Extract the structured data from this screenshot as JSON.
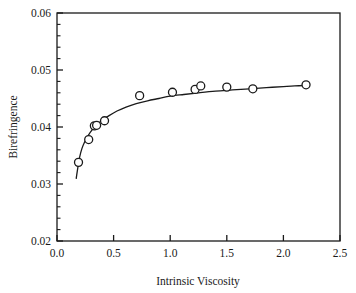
{
  "chart_data": {
    "type": "scatter",
    "title": "",
    "xlabel": "Intrinsic Viscosity",
    "ylabel": "Birefringence",
    "xlim": [
      0.0,
      2.5
    ],
    "ylim": [
      0.02,
      0.06
    ],
    "xticks": [
      0.0,
      0.5,
      1.0,
      1.5,
      2.0,
      2.5
    ],
    "xtick_labels": [
      "0.0",
      "0.5",
      "1.0",
      "1.5",
      "2.0",
      "2.5"
    ],
    "yticks": [
      0.02,
      0.03,
      0.04,
      0.05,
      0.06
    ],
    "ytick_labels": [
      "0.02",
      "0.03",
      "0.04",
      "0.05",
      "0.06"
    ],
    "y_minor_tick_count": 4,
    "x_minor_tick_count": 0,
    "grid": false,
    "legend": null,
    "marker": "open-circle",
    "series": [
      {
        "name": "Birefringence vs Intrinsic Viscosity",
        "points": [
          {
            "x": 0.19,
            "y": 0.0338
          },
          {
            "x": 0.28,
            "y": 0.0378
          },
          {
            "x": 0.33,
            "y": 0.0402
          },
          {
            "x": 0.35,
            "y": 0.0403
          },
          {
            "x": 0.42,
            "y": 0.0411
          },
          {
            "x": 0.73,
            "y": 0.0455
          },
          {
            "x": 1.02,
            "y": 0.0461
          },
          {
            "x": 1.22,
            "y": 0.0466
          },
          {
            "x": 1.27,
            "y": 0.0472
          },
          {
            "x": 1.5,
            "y": 0.047
          },
          {
            "x": 1.73,
            "y": 0.0467
          },
          {
            "x": 2.2,
            "y": 0.0474
          }
        ]
      }
    ],
    "fit_curve": {
      "name": "fitted-curve",
      "points": [
        {
          "x": 0.17,
          "y": 0.031
        },
        {
          "x": 0.185,
          "y": 0.033
        },
        {
          "x": 0.2,
          "y": 0.0347
        },
        {
          "x": 0.22,
          "y": 0.0362
        },
        {
          "x": 0.245,
          "y": 0.0374
        },
        {
          "x": 0.275,
          "y": 0.0385
        },
        {
          "x": 0.31,
          "y": 0.0395
        },
        {
          "x": 0.35,
          "y": 0.0404
        },
        {
          "x": 0.4,
          "y": 0.0412
        },
        {
          "x": 0.46,
          "y": 0.042
        },
        {
          "x": 0.53,
          "y": 0.0428
        },
        {
          "x": 0.61,
          "y": 0.0435
        },
        {
          "x": 0.7,
          "y": 0.0441
        },
        {
          "x": 0.8,
          "y": 0.0446
        },
        {
          "x": 0.9,
          "y": 0.045
        },
        {
          "x": 1.0,
          "y": 0.0454
        },
        {
          "x": 1.12,
          "y": 0.0457
        },
        {
          "x": 1.25,
          "y": 0.046
        },
        {
          "x": 1.4,
          "y": 0.0463
        },
        {
          "x": 1.55,
          "y": 0.0465
        },
        {
          "x": 1.7,
          "y": 0.0467
        },
        {
          "x": 1.85,
          "y": 0.0469
        },
        {
          "x": 2.0,
          "y": 0.0471
        },
        {
          "x": 2.1,
          "y": 0.0472
        },
        {
          "x": 2.2,
          "y": 0.0473
        }
      ]
    }
  }
}
